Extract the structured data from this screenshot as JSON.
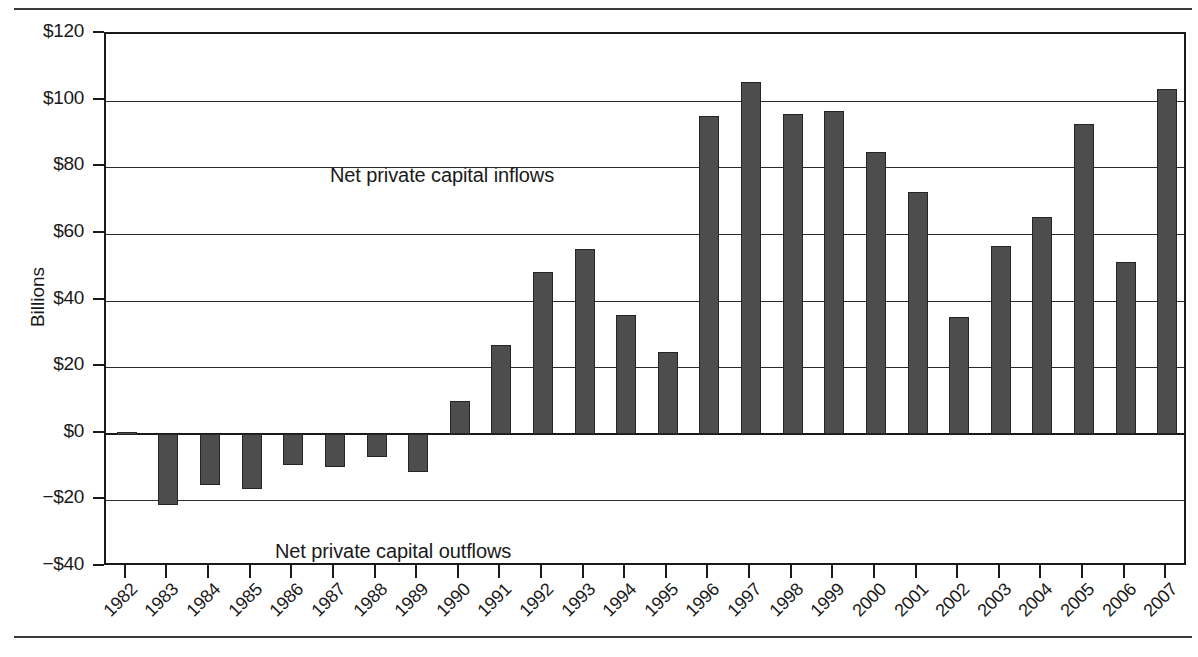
{
  "chart_data": {
    "type": "bar",
    "title": "",
    "xlabel": "",
    "ylabel": "Billions",
    "ylim": [
      -40,
      120
    ],
    "ytick_labels": [
      "$120",
      "$100",
      "$80",
      "$60",
      "$40",
      "$20",
      "$0",
      "−$20",
      "−$40"
    ],
    "ytick_values": [
      120,
      100,
      80,
      60,
      40,
      20,
      0,
      -20,
      -40
    ],
    "grid": true,
    "legend": "none",
    "categories": [
      "1982",
      "1983",
      "1984",
      "1985",
      "1986",
      "1987",
      "1988",
      "1989",
      "1990",
      "1991",
      "1992",
      "1993",
      "1994",
      "1995",
      "1996",
      "1997",
      "1998",
      "1999",
      "2000",
      "2001",
      "2002",
      "2003",
      "2004",
      "2005",
      "2006",
      "2007"
    ],
    "values": [
      0.5,
      -21.5,
      -15.5,
      -16.5,
      -9.5,
      -10.0,
      -7.0,
      -11.5,
      9.8,
      26.5,
      48.5,
      55.5,
      35.5,
      24.5,
      95.5,
      105.5,
      96.0,
      97.0,
      84.5,
      72.5,
      35.0,
      56.5,
      65.0,
      93.0,
      51.5,
      103.5
    ],
    "annotations": [
      {
        "id": "inflows",
        "text": "Net private capital inflows"
      },
      {
        "id": "outflows",
        "text": "Net private capital outflows"
      }
    ],
    "colors": {
      "bar_fill": "#4d4d4d",
      "bar_edge": "#252525",
      "axis": "#1a1a1a",
      "grid": "#2b2b2b",
      "background": "#ffffff"
    }
  }
}
